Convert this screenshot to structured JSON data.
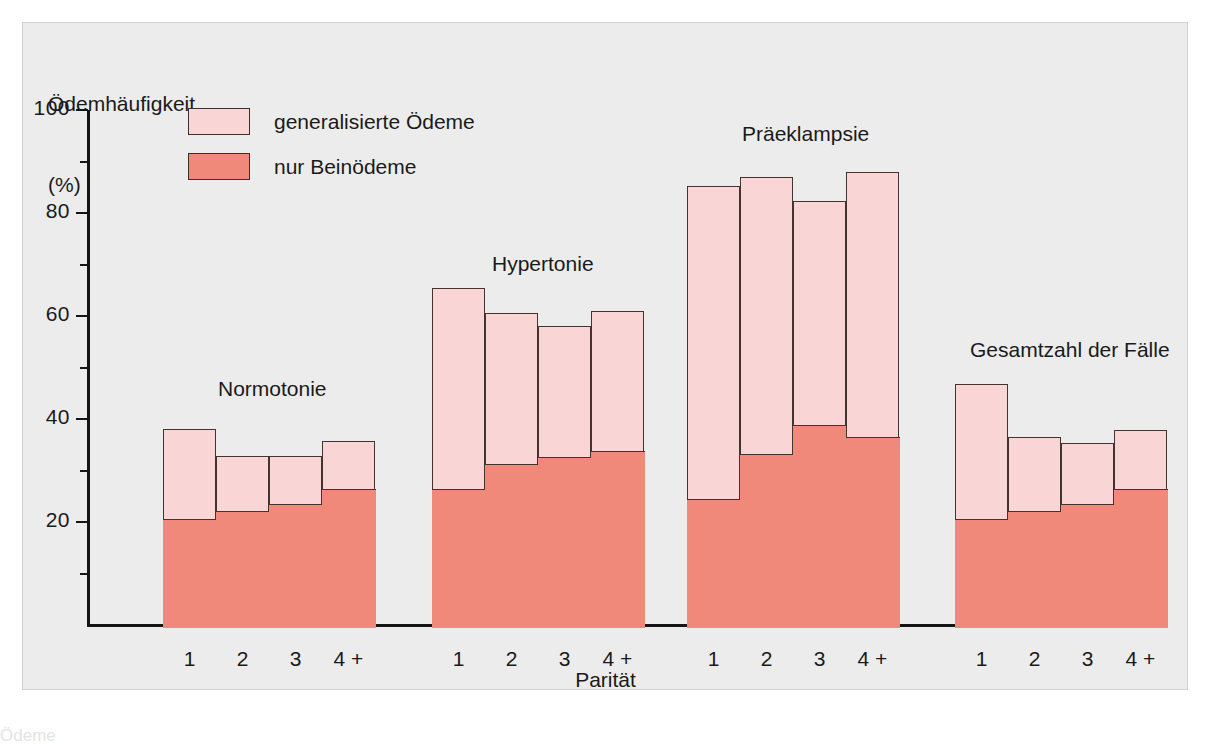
{
  "chart_data": {
    "type": "bar",
    "subtype": "stacked-bar-grouped",
    "title": "",
    "ylabel": "Ödemhäufigkeit",
    "yunit": "(%)",
    "xlabel": "Parität",
    "ylim": [
      0,
      100
    ],
    "y_major_ticks": [
      100,
      80,
      60,
      40,
      20
    ],
    "y_minor_ticks": [
      90,
      70,
      50,
      30,
      10
    ],
    "grid": false,
    "legend_position": "top-left-inside",
    "categories": [
      "1",
      "2",
      "3",
      "4 +"
    ],
    "series": [
      {
        "name": "nur Beinödeme",
        "color": "#f0897a",
        "stack_order": 0
      },
      {
        "name": "generalisierte Ödeme",
        "color": "#f9d5d5",
        "stack_order": 1
      }
    ],
    "groups": [
      {
        "label": "Normotonie",
        "bars": [
          {
            "category": "1",
            "nur_beinoedeme": 21.0,
            "total": 38.5
          },
          {
            "category": "2",
            "nur_beinoedeme": 22.7,
            "total": 33.2
          },
          {
            "category": "3",
            "nur_beinoedeme": 24.0,
            "total": 33.2
          },
          {
            "category": "4 +",
            "nur_beinoedeme": 26.8,
            "total": 36.2
          }
        ]
      },
      {
        "label": "Hypertonie",
        "bars": [
          {
            "category": "1",
            "nur_beinoedeme": 26.8,
            "total": 65.8
          },
          {
            "category": "2",
            "nur_beinoedeme": 31.8,
            "total": 61.0
          },
          {
            "category": "3",
            "nur_beinoedeme": 33.1,
            "total": 58.5
          },
          {
            "category": "4 +",
            "nur_beinoedeme": 34.3,
            "total": 61.3
          }
        ]
      },
      {
        "label": "Präeklampsie",
        "bars": [
          {
            "category": "1",
            "nur_beinoedeme": 25.0,
            "total": 85.7
          },
          {
            "category": "2",
            "nur_beinoedeme": 33.6,
            "total": 87.4
          },
          {
            "category": "3",
            "nur_beinoedeme": 39.4,
            "total": 82.7
          },
          {
            "category": "4 +",
            "nur_beinoedeme": 37.0,
            "total": 88.3
          }
        ]
      },
      {
        "label": "Gesamtzahl der Fälle",
        "bars": [
          {
            "category": "1",
            "nur_beinoedeme": 21.0,
            "total": 47.2
          },
          {
            "category": "2",
            "nur_beinoedeme": 22.7,
            "total": 36.8
          },
          {
            "category": "3",
            "nur_beinoedeme": 24.0,
            "total": 35.8
          },
          {
            "category": "4 +",
            "nur_beinoedeme": 26.8,
            "total": 38.2
          }
        ]
      }
    ]
  },
  "legend": {
    "items": [
      {
        "label": "generalisierte Ödeme",
        "color": "#f9d5d5"
      },
      {
        "label": "nur Beinödeme",
        "color": "#f0897a"
      }
    ]
  },
  "axes": {
    "y_title_line1": "Ödemhäufigkeit",
    "y_title_line2": "(%)",
    "x_title": "Parität",
    "y_labels": [
      "100",
      "80",
      "60",
      "40",
      "20"
    ]
  },
  "colors": {
    "light_pink": "#f9d5d5",
    "salmon": "#f0897a",
    "outline": "#44332f",
    "background": "#ececec",
    "text": "#1a1a1a"
  },
  "caption": {
    "cut_off_text": "Ödeme"
  }
}
